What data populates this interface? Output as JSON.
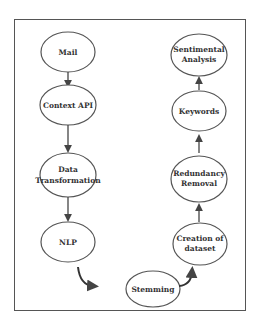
{
  "diagram": {
    "title": "",
    "nodes": [
      {
        "id": "mail",
        "lines": [
          "Mail"
        ],
        "cx": 68,
        "cy": 52
      },
      {
        "id": "context-api",
        "lines": [
          "Context API"
        ],
        "cx": 68,
        "cy": 105
      },
      {
        "id": "data-transformation",
        "lines": [
          "Data",
          "Transformation"
        ],
        "cx": 68,
        "cy": 171
      },
      {
        "id": "nlp",
        "lines": [
          "NLP"
        ],
        "cx": 68,
        "cy": 242
      },
      {
        "id": "stemming",
        "lines": [
          "Stemming"
        ],
        "cx": 153,
        "cy": 289
      },
      {
        "id": "creation-of-dataset",
        "lines": [
          "Creation of",
          "dataset"
        ],
        "cx": 200,
        "cy": 244
      },
      {
        "id": "redundancy-removal",
        "lines": [
          "Redundancy",
          "Removal"
        ],
        "cx": 199,
        "cy": 175
      },
      {
        "id": "keywords",
        "lines": [
          "Keywords"
        ],
        "cx": 199,
        "cy": 110
      },
      {
        "id": "sentimental-analysis",
        "lines": [
          "Sentimental",
          "Analysis"
        ],
        "cx": 199,
        "cy": 56
      }
    ],
    "edges": [
      {
        "from": "mail",
        "to": "context-api"
      },
      {
        "from": "context-api",
        "to": "data-transformation"
      },
      {
        "from": "data-transformation",
        "to": "nlp"
      },
      {
        "from": "nlp",
        "to": "stemming"
      },
      {
        "from": "stemming",
        "to": "creation-of-dataset"
      },
      {
        "from": "creation-of-dataset",
        "to": "redundancy-removal"
      },
      {
        "from": "redundancy-removal",
        "to": "keywords"
      },
      {
        "from": "keywords",
        "to": "sentimental-analysis"
      }
    ],
    "colors": {
      "stroke": "#555555",
      "text": "#333333",
      "background": "#ffffff"
    }
  }
}
